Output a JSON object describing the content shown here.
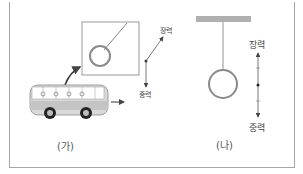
{
  "diagram": {
    "panel_a": {
      "caption": "(가)",
      "force_labels": {
        "tension": "장력",
        "gravity": "중력"
      }
    },
    "panel_b": {
      "caption": "(나)",
      "force_labels": {
        "tension": "장력",
        "gravity": "중력"
      }
    },
    "colors": {
      "ring": "#8a8a8a",
      "bus_body": "#d8d8d8",
      "ceiling": "#b0b0b0",
      "vector": "#555555"
    }
  }
}
